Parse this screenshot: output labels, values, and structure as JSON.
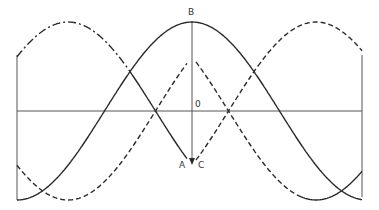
{
  "diagram": {
    "title": "",
    "colors": {
      "stroke": "#2a2a2a",
      "axis": "#555555",
      "background": "#ffffff"
    },
    "labels": {
      "B": "B",
      "O": "0",
      "A": "A",
      "C": "C"
    },
    "geometry": {
      "left_x": 17,
      "right_x": 362,
      "axis_y": 111,
      "center_x": 192,
      "amplitude": 89,
      "period": 350,
      "top_boundary_y": 55,
      "arrow_tip_y": 165
    },
    "curves": [
      {
        "name": "solid-wave",
        "style": "solid",
        "peak_x": 192
      },
      {
        "name": "dash-dot-wave-left",
        "style": "dashdot",
        "peak_x": 68
      },
      {
        "name": "dashed-wave-right",
        "style": "dashed",
        "peak_x": 316
      }
    ]
  }
}
